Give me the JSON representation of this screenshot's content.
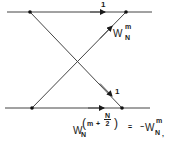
{
  "diagram": {
    "type": "butterfly",
    "colors": {
      "line": "#333333",
      "node": "#111111",
      "background": "#ffffff"
    },
    "nodes": [
      {
        "id": "in-top",
        "x": 30,
        "y": 12
      },
      {
        "id": "out-top",
        "x": 126,
        "y": 12
      },
      {
        "id": "in-bottom",
        "x": 32,
        "y": 108
      },
      {
        "id": "out-bottom",
        "x": 122,
        "y": 108
      }
    ],
    "edges": [
      {
        "from": "in-top",
        "to": "out-top",
        "weight": "1"
      },
      {
        "from": "in-bottom",
        "to": "out-top",
        "weight": "W_N^m"
      },
      {
        "from": "in-top",
        "to": "out-bottom",
        "weight": "1"
      },
      {
        "from": "in-bottom",
        "to": "out-bottom",
        "weight": ""
      }
    ],
    "labels": {
      "top_edge_weight": "1",
      "cross_edge_weight_bottom": "1",
      "twiddle": {
        "base": "W",
        "sup": "m",
        "sub": "N"
      },
      "identity": {
        "lhs_base": "W",
        "lhs_sub": "N",
        "lhs_open": "(",
        "lhs_m": "m",
        "lhs_plus": "+",
        "lhs_frac_num": "N",
        "lhs_frac_den": "2",
        "lhs_close": ")",
        "equals": "=",
        "rhs_minus": "−",
        "rhs_base": "W",
        "rhs_sup": "m",
        "rhs_sub": "N",
        "trailing": ","
      }
    }
  }
}
